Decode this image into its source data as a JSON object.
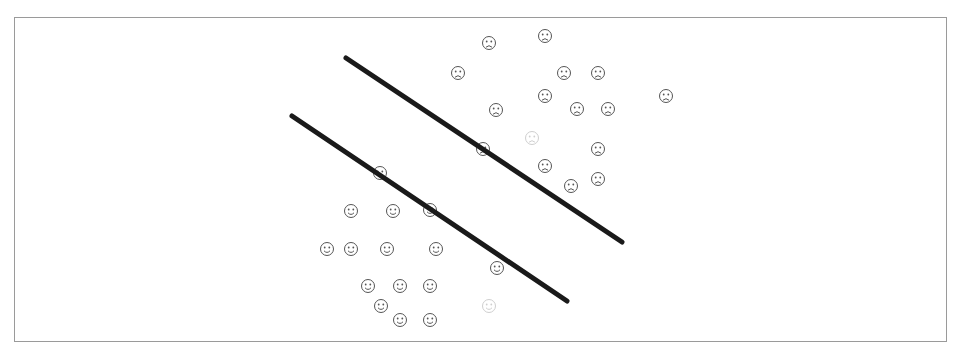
{
  "diagram": {
    "colors": {
      "line": "#1a1a1a",
      "face": "#555555",
      "faded_face": "#cfcfcf",
      "frame": "#9a9a9a"
    },
    "lines": [
      {
        "id": "upper-margin-line",
        "x1": 346,
        "y1": 58,
        "x2": 622,
        "y2": 242
      },
      {
        "id": "lower-margin-line",
        "x1": 292,
        "y1": 116,
        "x2": 567,
        "y2": 301
      }
    ],
    "sad_faces": [
      {
        "x": 489,
        "y": 43
      },
      {
        "x": 545,
        "y": 36
      },
      {
        "x": 458,
        "y": 73
      },
      {
        "x": 564,
        "y": 73
      },
      {
        "x": 598,
        "y": 73
      },
      {
        "x": 545,
        "y": 96
      },
      {
        "x": 666,
        "y": 96
      },
      {
        "x": 496,
        "y": 110
      },
      {
        "x": 577,
        "y": 109
      },
      {
        "x": 608,
        "y": 109
      },
      {
        "x": 598,
        "y": 149
      },
      {
        "x": 545,
        "y": 166
      },
      {
        "x": 571,
        "y": 186
      },
      {
        "x": 598,
        "y": 179
      },
      {
        "x": 483,
        "y": 149
      }
    ],
    "happy_faces": [
      {
        "x": 380,
        "y": 173
      },
      {
        "x": 351,
        "y": 211
      },
      {
        "x": 393,
        "y": 211
      },
      {
        "x": 430,
        "y": 210
      },
      {
        "x": 327,
        "y": 249
      },
      {
        "x": 351,
        "y": 249
      },
      {
        "x": 387,
        "y": 249
      },
      {
        "x": 436,
        "y": 249
      },
      {
        "x": 497,
        "y": 268
      },
      {
        "x": 368,
        "y": 286
      },
      {
        "x": 400,
        "y": 286
      },
      {
        "x": 430,
        "y": 286
      },
      {
        "x": 381,
        "y": 306
      },
      {
        "x": 400,
        "y": 320
      },
      {
        "x": 430,
        "y": 320
      }
    ],
    "faded_faces": [
      {
        "x": 532,
        "y": 138,
        "kind": "sad"
      },
      {
        "x": 489,
        "y": 306,
        "kind": "happy"
      }
    ],
    "glyphs": {
      "sad": "☹",
      "happy": "☺"
    }
  }
}
